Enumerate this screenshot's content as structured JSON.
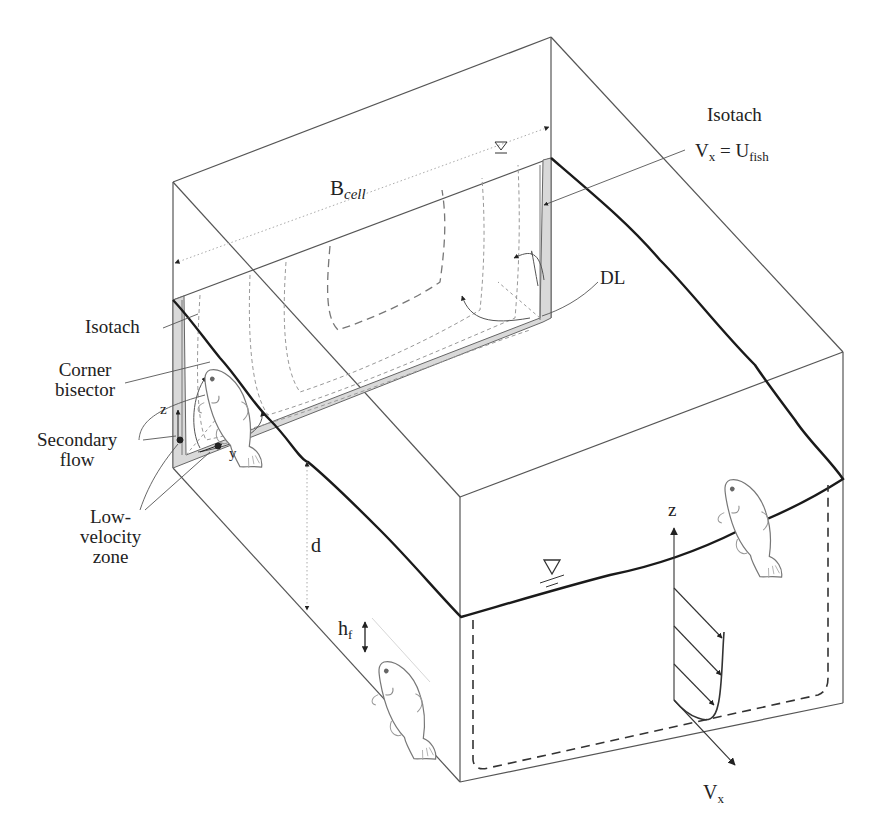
{
  "figure": {
    "colors": {
      "line": "#555555",
      "bold": "#1a1a1a",
      "shade": "#d9d9d9",
      "dash": "#999999"
    }
  },
  "labels": {
    "isotach_top": "Isotach",
    "vx_eq": "V",
    "vx_sub": "x",
    "eq_mid": " = U",
    "ufish_sub": "fish",
    "bcell": "B",
    "bcell_sub": "cell",
    "dl": "DL",
    "isotach_left": "Isotach",
    "corner_bisector_1": "Corner",
    "corner_bisector_2": "bisector",
    "secondary_flow_1": "Secondary",
    "secondary_flow_2": "flow",
    "low_velocity_1": "Low-",
    "low_velocity_2": "velocity",
    "low_velocity_3": "zone",
    "axis_z_left": "z",
    "axis_y_left": "y",
    "depth": "d",
    "hf": "h",
    "hf_sub": "f",
    "axis_z_right": "z",
    "axis_vx": "V",
    "axis_vx_sub": "x"
  }
}
